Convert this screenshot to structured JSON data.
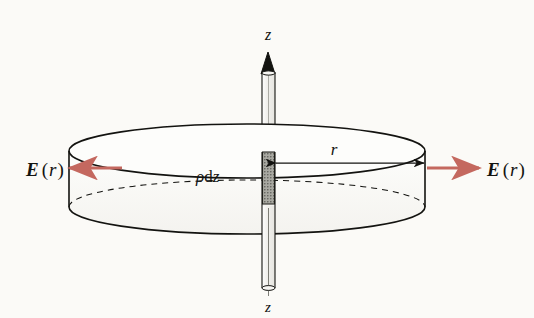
{
  "figure": {
    "background_color": "#fbfaf7",
    "ink_color": "#131310",
    "field_arrow_color": "#c4685f",
    "shaded_element_color": "#8c8c86"
  },
  "axis": {
    "name": "z-axis",
    "top_label": "z",
    "bottom_label": "z",
    "arrow_direction": "up"
  },
  "labels": {
    "charge_element": {
      "parts": [
        "ρ",
        "d",
        "z"
      ],
      "text": "ρdz",
      "meaning": "line-charge element rho d z"
    },
    "radius": {
      "text": "r",
      "meaning": "radius of the Gaussian cylinder"
    },
    "field_left": {
      "vector": "E",
      "argument": "r",
      "open_paren": "(",
      "close_paren": ")",
      "text": "E(r)"
    },
    "field_right": {
      "vector": "E",
      "argument": "r",
      "open_paren": "(",
      "close_paren": ")",
      "text": "E(r)"
    }
  },
  "geometry": {
    "cylinder": {
      "center_x": 247,
      "top_ellipse_cy": 151,
      "bottom_ellipse_cy": 207,
      "rx": 178,
      "ry": 27
    },
    "rod": {
      "center_x": 268,
      "half_width": 6,
      "top_y": 52,
      "bottom_y": 290
    },
    "charge_element_box": {
      "x": 262,
      "y": 152,
      "width": 13,
      "height": 52
    },
    "radius_line": {
      "x1": 270,
      "x2": 424,
      "y": 163
    },
    "field_arrows": {
      "y": 168,
      "left": {
        "tail_x": 122,
        "head_x": 67
      },
      "right": {
        "tail_x": 427,
        "head_x": 482
      }
    }
  }
}
